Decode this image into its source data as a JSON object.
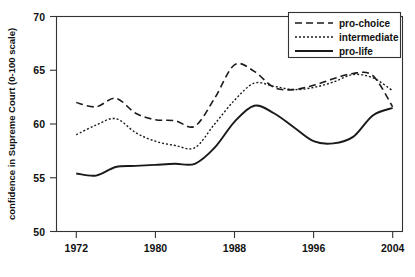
{
  "chart_data": {
    "type": "line",
    "title": "",
    "xlabel": "",
    "ylabel": "confidence in Supreme Court (0-100 scale)",
    "xlim": [
      1970,
      2005
    ],
    "ylim": [
      50,
      70
    ],
    "grid": false,
    "legend_position": "top-right",
    "xticks": [
      1972,
      1980,
      1988,
      1996,
      2004
    ],
    "yticks": [
      50,
      55,
      60,
      65,
      70
    ],
    "x": [
      1972,
      1974,
      1976,
      1978,
      1980,
      1982,
      1984,
      1986,
      1988,
      1990,
      1992,
      1994,
      1996,
      1998,
      2000,
      2002,
      2004
    ],
    "series": [
      {
        "name": "pro-choice",
        "style": "dashed",
        "values": [
          62.0,
          61.6,
          62.4,
          61.0,
          60.4,
          60.3,
          59.8,
          62.4,
          65.5,
          64.9,
          63.4,
          63.2,
          63.6,
          64.2,
          64.7,
          64.5,
          61.6
        ]
      },
      {
        "name": "intermediate",
        "style": "dotted",
        "values": [
          59.0,
          59.9,
          60.5,
          59.2,
          58.4,
          58.0,
          57.8,
          60.0,
          62.2,
          63.8,
          63.5,
          63.2,
          63.4,
          63.9,
          64.6,
          64.3,
          63.1
        ]
      },
      {
        "name": "pro-life",
        "style": "solid",
        "values": [
          55.4,
          55.2,
          56.0,
          56.1,
          56.2,
          56.3,
          56.3,
          57.8,
          60.2,
          61.7,
          61.0,
          59.7,
          58.4,
          58.2,
          58.8,
          60.8,
          61.5
        ]
      }
    ]
  },
  "axes": {
    "y_title": "confidence in Supreme Court (0-100 scale)",
    "y_tick_labels": [
      "70",
      "65",
      "60",
      "55",
      "50"
    ],
    "x_tick_labels": [
      "1972",
      "1980",
      "1988",
      "1996",
      "2004"
    ]
  },
  "legend": {
    "entries": [
      {
        "label": "pro-choice",
        "style": "dashed"
      },
      {
        "label": "intermediate",
        "style": "dotted"
      },
      {
        "label": "pro-life",
        "style": "solid"
      }
    ]
  },
  "colors": {
    "line": "#1a1a1a",
    "axis": "#333333",
    "background": "#ffffff"
  }
}
